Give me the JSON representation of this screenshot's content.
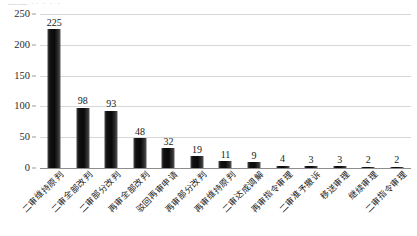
{
  "figure": {
    "top_artifact_text": "——  ··  · · ·",
    "background_color": "#ffffff",
    "bar_color": "#111111",
    "gridline_color": "#d7d7d7",
    "axis_color": "#8d8d8d"
  },
  "chart_data": {
    "type": "bar",
    "title": "",
    "xlabel": "",
    "ylabel": "",
    "ylim": [
      0,
      250
    ],
    "yticks": [
      0,
      50,
      100,
      150,
      200,
      250
    ],
    "ytick_labels": [
      "0",
      "50",
      "100",
      "150",
      "200",
      "250"
    ],
    "grid": true,
    "legend": false,
    "orientation": "vertical",
    "categories": [
      "二审维持原判",
      "二审全部改判",
      "二审部分改判",
      "再审全部改判",
      "驳回再审申请",
      "再审部分改判",
      "再审维持原判",
      "二审达成调解",
      "再审指令审理",
      "二审准予撤诉",
      "移送审理",
      "继续审理",
      "二审指令审理"
    ],
    "values": [
      225,
      98,
      93,
      48,
      32,
      19,
      11,
      9,
      4,
      3,
      3,
      2,
      2
    ],
    "value_labels": [
      "225",
      "98",
      "93",
      "48",
      "32",
      "19",
      "11",
      "9",
      "4",
      "3",
      "3",
      "2",
      "2"
    ]
  }
}
